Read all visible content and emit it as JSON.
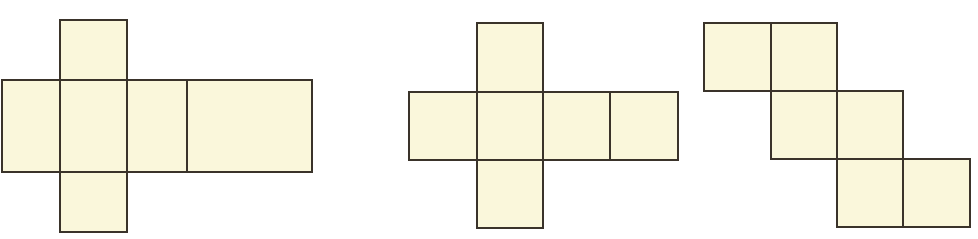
{
  "figure": {
    "canvas": {
      "width": 978,
      "height": 239
    },
    "background_color": "#FFFFFF",
    "square_fill_color": "#FAF7DB",
    "square_stroke_color": "#3A332A",
    "stroke_width": 2,
    "unit_square_size": 67,
    "nets": [
      {
        "id": "net-1",
        "name": "net-cross-long-arm",
        "label": "Figure 1",
        "square_count": 6,
        "description": "Central square with squares above, below, left, and two squares extending right",
        "squares": [
          {
            "name": "net-1-square-top",
            "x": 60,
            "y": 20,
            "w": 67,
            "h": 60
          },
          {
            "name": "net-1-square-left",
            "x": 2,
            "y": 80,
            "w": 58,
            "h": 92
          },
          {
            "name": "net-1-square-center",
            "x": 60,
            "y": 80,
            "w": 67,
            "h": 92
          },
          {
            "name": "net-1-square-right-inner",
            "x": 127,
            "y": 80,
            "w": 60,
            "h": 92
          },
          {
            "name": "net-1-square-right-outer",
            "x": 187,
            "y": 80,
            "w": 125,
            "h": 92
          },
          {
            "name": "net-1-square-bottom",
            "x": 60,
            "y": 172,
            "w": 67,
            "h": 60
          }
        ],
        "bounds": {
          "x": 2,
          "y": 20,
          "w": 310,
          "h": 212
        }
      },
      {
        "id": "net-2",
        "name": "net-cross-plus",
        "label": "Figure 2",
        "square_count": 6,
        "description": "Plus-shaped cross: center square with top, bottom, left and two right squares",
        "squares": [
          {
            "name": "net-2-square-top",
            "x": 477,
            "y": 23,
            "w": 66,
            "h": 69
          },
          {
            "name": "net-2-square-left",
            "x": 409,
            "y": 92,
            "w": 68,
            "h": 68
          },
          {
            "name": "net-2-square-center",
            "x": 477,
            "y": 92,
            "w": 66,
            "h": 68
          },
          {
            "name": "net-2-square-right-inner",
            "x": 543,
            "y": 92,
            "w": 67,
            "h": 68
          },
          {
            "name": "net-2-square-right-outer",
            "x": 610,
            "y": 92,
            "w": 68,
            "h": 68
          },
          {
            "name": "net-2-square-bottom",
            "x": 477,
            "y": 160,
            "w": 66,
            "h": 68
          }
        ],
        "bounds": {
          "x": 409,
          "y": 23,
          "w": 269,
          "h": 205
        }
      },
      {
        "id": "net-3",
        "name": "net-staircase",
        "label": "Figure 3",
        "square_count": 6,
        "description": "Staircase of three rows of two squares, each row shifted one square right",
        "squares": [
          {
            "name": "net-3-square-row1-left",
            "x": 704,
            "y": 23,
            "w": 67,
            "h": 68
          },
          {
            "name": "net-3-square-row1-right",
            "x": 771,
            "y": 23,
            "w": 66,
            "h": 68
          },
          {
            "name": "net-3-square-row2-left",
            "x": 771,
            "y": 91,
            "w": 66,
            "h": 68
          },
          {
            "name": "net-3-square-row2-right",
            "x": 837,
            "y": 91,
            "w": 66,
            "h": 68
          },
          {
            "name": "net-3-square-row3-left",
            "x": 837,
            "y": 159,
            "w": 66,
            "h": 68
          },
          {
            "name": "net-3-square-row3-right",
            "x": 903,
            "y": 159,
            "w": 67,
            "h": 68
          }
        ],
        "bounds": {
          "x": 704,
          "y": 23,
          "w": 266,
          "h": 204
        }
      }
    ]
  }
}
